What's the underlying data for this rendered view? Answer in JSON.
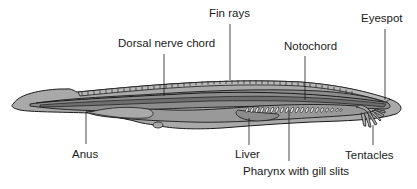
{
  "diagram": {
    "labels": {
      "fin_rays": "Fin rays",
      "eyespot": "Eyespot",
      "dorsal_nerve_chord": "Dorsal  nerve chord",
      "notochord": "Notochord",
      "anus": "Anus",
      "liver": "Liver",
      "tentacles": "Tentacles",
      "pharynx": "Pharynx with gill slits"
    },
    "colors": {
      "body_outer": "#a9a9a9",
      "body_inner": "#8c8c8c",
      "body_dark": "#6e6e6e",
      "outline": "#1a1a1a",
      "gill_slit": "#ffffff",
      "label_text": "#1a1a1a",
      "background": "#ffffff"
    }
  }
}
